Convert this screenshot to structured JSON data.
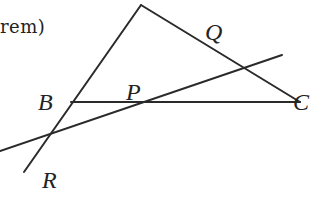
{
  "caption": "rem)",
  "diagram": {
    "labels": {
      "B": "B",
      "P": "P",
      "C": "C",
      "Q": "Q",
      "R": "R"
    },
    "stroke_color": "#2a2a2a",
    "points": {
      "A": [
        141,
        5
      ],
      "B": [
        71,
        102
      ],
      "C": [
        300,
        102
      ],
      "P": [
        131,
        102
      ],
      "Q_on_AC": [
        244,
        67
      ],
      "R": [
        52,
        132
      ]
    }
  }
}
